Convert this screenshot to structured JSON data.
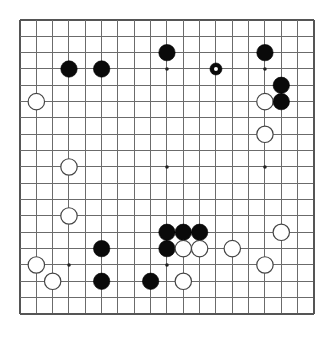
{
  "diagram": {
    "kind": "go-board-diagram",
    "board_size": 19,
    "background_color": "#ffffff",
    "line_color": "#6b6b6b",
    "black_color": "#0a0a0a",
    "white_color": "#ffffff",
    "geometry": {
      "origin_x": 20,
      "origin_y": 20,
      "spacing": 16.33,
      "stone_radius": 8.2,
      "small_stone_radius": 6.0,
      "star_radius": 1.8
    },
    "star_points": [
      {
        "col": 3,
        "row": 3
      },
      {
        "col": 9,
        "row": 3
      },
      {
        "col": 15,
        "row": 3
      },
      {
        "col": 3,
        "row": 9
      },
      {
        "col": 9,
        "row": 9
      },
      {
        "col": 15,
        "row": 9
      },
      {
        "col": 3,
        "row": 15
      },
      {
        "col": 9,
        "row": 15
      },
      {
        "col": 15,
        "row": 15
      }
    ],
    "stones": [
      {
        "col": 9,
        "row": 2,
        "color": "black",
        "size": "normal",
        "marked": false
      },
      {
        "col": 15,
        "row": 2,
        "color": "black",
        "size": "normal",
        "marked": false
      },
      {
        "col": 3,
        "row": 3,
        "color": "black",
        "size": "normal",
        "marked": false
      },
      {
        "col": 5,
        "row": 3,
        "color": "black",
        "size": "normal",
        "marked": false
      },
      {
        "col": 12,
        "row": 3,
        "color": "black",
        "size": "small",
        "marked": true
      },
      {
        "col": 16,
        "row": 4,
        "color": "black",
        "size": "normal",
        "marked": false
      },
      {
        "col": 1,
        "row": 5,
        "color": "white",
        "size": "normal",
        "marked": false
      },
      {
        "col": 15,
        "row": 5,
        "color": "white",
        "size": "normal",
        "marked": false
      },
      {
        "col": 16,
        "row": 5,
        "color": "black",
        "size": "normal",
        "marked": false
      },
      {
        "col": 15,
        "row": 7,
        "color": "white",
        "size": "normal",
        "marked": false
      },
      {
        "col": 3,
        "row": 9,
        "color": "white",
        "size": "normal",
        "marked": false
      },
      {
        "col": 3,
        "row": 12,
        "color": "white",
        "size": "normal",
        "marked": false
      },
      {
        "col": 9,
        "row": 13,
        "color": "black",
        "size": "normal",
        "marked": false
      },
      {
        "col": 10,
        "row": 13,
        "color": "black",
        "size": "normal",
        "marked": false
      },
      {
        "col": 11,
        "row": 13,
        "color": "black",
        "size": "normal",
        "marked": false
      },
      {
        "col": 16,
        "row": 13,
        "color": "white",
        "size": "normal",
        "marked": false
      },
      {
        "col": 5,
        "row": 14,
        "color": "black",
        "size": "normal",
        "marked": false
      },
      {
        "col": 9,
        "row": 14,
        "color": "black",
        "size": "normal",
        "marked": false
      },
      {
        "col": 10,
        "row": 14,
        "color": "white",
        "size": "normal",
        "marked": false
      },
      {
        "col": 11,
        "row": 14,
        "color": "white",
        "size": "normal",
        "marked": false
      },
      {
        "col": 13,
        "row": 14,
        "color": "white",
        "size": "normal",
        "marked": false
      },
      {
        "col": 1,
        "row": 15,
        "color": "white",
        "size": "normal",
        "marked": false
      },
      {
        "col": 15,
        "row": 15,
        "color": "white",
        "size": "normal",
        "marked": false
      },
      {
        "col": 2,
        "row": 16,
        "color": "white",
        "size": "normal",
        "marked": false
      },
      {
        "col": 5,
        "row": 16,
        "color": "black",
        "size": "normal",
        "marked": false
      },
      {
        "col": 8,
        "row": 16,
        "color": "black",
        "size": "normal",
        "marked": false
      },
      {
        "col": 10,
        "row": 16,
        "color": "white",
        "size": "normal",
        "marked": false
      }
    ]
  }
}
